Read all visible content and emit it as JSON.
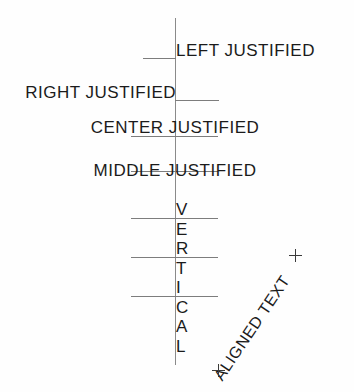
{
  "diagram": {
    "background_color": "#fefefe",
    "line_color": "#7d7d7d",
    "text_color": "#1b1b1b",
    "labels": {
      "left_justified": "LEFT JUSTIFIED",
      "right_justified": "RIGHT JUSTIFIED",
      "center_justified": "CENTER JUSTIFIED",
      "middle_justified": "MIDDLE JUSTIFIED",
      "aligned_text": "ALIGNED TEXT"
    },
    "vertical_text": {
      "word": "VERTICAL",
      "letters": [
        "V",
        "E",
        "R",
        "T",
        "I",
        "C",
        "A",
        "L"
      ]
    }
  }
}
